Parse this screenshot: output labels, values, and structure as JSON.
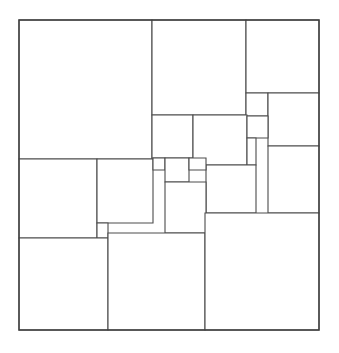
{
  "figure": {
    "kind": "squared-square-dissection",
    "background_color": "#ffffff",
    "line_color": "#4c4c4c",
    "outer_line_color": "#3f3f3f",
    "line_width": 1.1,
    "canvas": {
      "width": 339,
      "height": 353
    }
  },
  "outer_square": {
    "label": "outer-boundary",
    "x": 19,
    "y": 20,
    "width": 300,
    "height": 310
  },
  "squares": [
    {
      "id": "A",
      "x": 19,
      "y": 20,
      "w": 133,
      "h": 139
    },
    {
      "id": "B",
      "x": 152,
      "y": 20,
      "w": 94,
      "h": 95
    },
    {
      "id": "C",
      "x": 246,
      "y": 20,
      "w": 73,
      "h": 73
    },
    {
      "id": "D",
      "x": 246,
      "y": 93,
      "w": 22,
      "h": 23
    },
    {
      "id": "E",
      "x": 268,
      "y": 93,
      "w": 51,
      "h": 53
    },
    {
      "id": "F",
      "x": 152,
      "y": 115,
      "w": 41,
      "h": 43
    },
    {
      "id": "G",
      "x": 193,
      "y": 115,
      "w": 54,
      "h": 50
    },
    {
      "id": "H",
      "x": 247,
      "y": 116,
      "w": 21,
      "h": 22
    },
    {
      "id": "I",
      "x": 247,
      "y": 138,
      "w": 9,
      "h": 27
    },
    {
      "id": "J",
      "x": 268,
      "y": 146,
      "w": 51,
      "h": 67
    },
    {
      "id": "K",
      "x": 206,
      "y": 165,
      "w": 50,
      "h": 48
    },
    {
      "id": "L",
      "x": 19,
      "y": 159,
      "w": 78,
      "h": 79
    },
    {
      "id": "M",
      "x": 97,
      "y": 159,
      "w": 56,
      "h": 64
    },
    {
      "id": "N",
      "x": 153,
      "y": 158,
      "w": 12,
      "h": 12
    },
    {
      "id": "O",
      "x": 165,
      "y": 158,
      "w": 24,
      "h": 24
    },
    {
      "id": "P",
      "x": 189,
      "y": 158,
      "w": 17,
      "h": 12
    },
    {
      "id": "Q",
      "x": 165,
      "y": 182,
      "w": 41,
      "h": 51
    },
    {
      "id": "R",
      "x": 97,
      "y": 223,
      "w": 11,
      "h": 15
    },
    {
      "id": "S",
      "x": 19,
      "y": 238,
      "w": 89,
      "h": 92
    },
    {
      "id": "T",
      "x": 108,
      "y": 233,
      "w": 97,
      "h": 97
    },
    {
      "id": "U",
      "x": 205,
      "y": 213,
      "w": 114,
      "h": 117
    }
  ],
  "edges": {
    "vertical_cuts": [
      152,
      246,
      268,
      247,
      193,
      206,
      256,
      97,
      153,
      165,
      189,
      108,
      205
    ],
    "horizontal_cuts": [
      115,
      93,
      146,
      159,
      158,
      165,
      182,
      213,
      223,
      233,
      238
    ]
  },
  "counts": {
    "square_count": 21,
    "order_label": "21"
  }
}
